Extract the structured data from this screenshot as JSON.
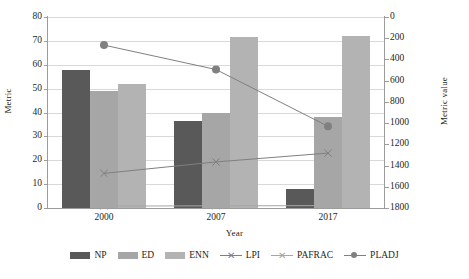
{
  "chart_data": {
    "type": "bar",
    "title": "",
    "xlabel": "Year",
    "ylabel": "Metric",
    "y2label": "Metric value",
    "categories": [
      "2000",
      "2007",
      "2017"
    ],
    "ylim": [
      0,
      80
    ],
    "yticks": [
      0,
      10,
      20,
      30,
      40,
      50,
      60,
      70,
      80
    ],
    "y2lim": [
      0,
      1800
    ],
    "y2ticks": [
      0,
      200,
      400,
      600,
      800,
      1000,
      1200,
      1400,
      1600,
      1800
    ],
    "y2_inverted": true,
    "grid": true,
    "legend_position": "bottom",
    "series": [
      {
        "name": "NP",
        "type": "bar",
        "axis": "left",
        "color": "#595959",
        "values": [
          58,
          36.5,
          8
        ]
      },
      {
        "name": "ED",
        "type": "bar",
        "axis": "left",
        "color": "#a6a6a6",
        "values": [
          49,
          40,
          38
        ]
      },
      {
        "name": "ENN",
        "type": "bar",
        "axis": "left",
        "color": "#b3b3b3",
        "values": [
          52,
          71.5,
          72
        ]
      },
      {
        "name": "LPI",
        "type": "line",
        "axis": "left",
        "marker": "x",
        "color": "#7f7f7f",
        "values": [
          14.5,
          19.3,
          23
        ]
      },
      {
        "name": "PAFRAC",
        "type": "line",
        "axis": "left",
        "marker": "x",
        "color": "#a6a6a6",
        "values": [
          0.8,
          0.9,
          1.0
        ]
      },
      {
        "name": "PLADJ",
        "type": "line",
        "axis": "right",
        "marker": "circle",
        "color": "#808080",
        "values": [
          265,
          495,
          1030
        ]
      }
    ]
  },
  "axes": {
    "y_left_title": "Metric",
    "y_right_title": "Metric value",
    "x_title": "Year",
    "y_left_ticks": [
      "80",
      "70",
      "60",
      "50",
      "40",
      "30",
      "20",
      "10",
      "0"
    ],
    "y_right_ticks": [
      "0",
      "200",
      "400",
      "600",
      "800",
      "1000",
      "1200",
      "1400",
      "1600",
      "1800"
    ],
    "x_ticks": [
      "2000",
      "2007",
      "2017"
    ]
  },
  "legend": {
    "items": [
      {
        "label": "NP",
        "marker": "bar",
        "color": "#595959"
      },
      {
        "label": "ED",
        "marker": "bar",
        "color": "#a6a6a6"
      },
      {
        "label": "ENN",
        "marker": "bar",
        "color": "#b3b3b3"
      },
      {
        "label": "LPI",
        "marker": "x-line",
        "color": "#7f7f7f"
      },
      {
        "label": "PAFRAC",
        "marker": "x-line",
        "color": "#a6a6a6"
      },
      {
        "label": "PLADJ",
        "marker": "circle-line",
        "color": "#808080"
      }
    ]
  }
}
